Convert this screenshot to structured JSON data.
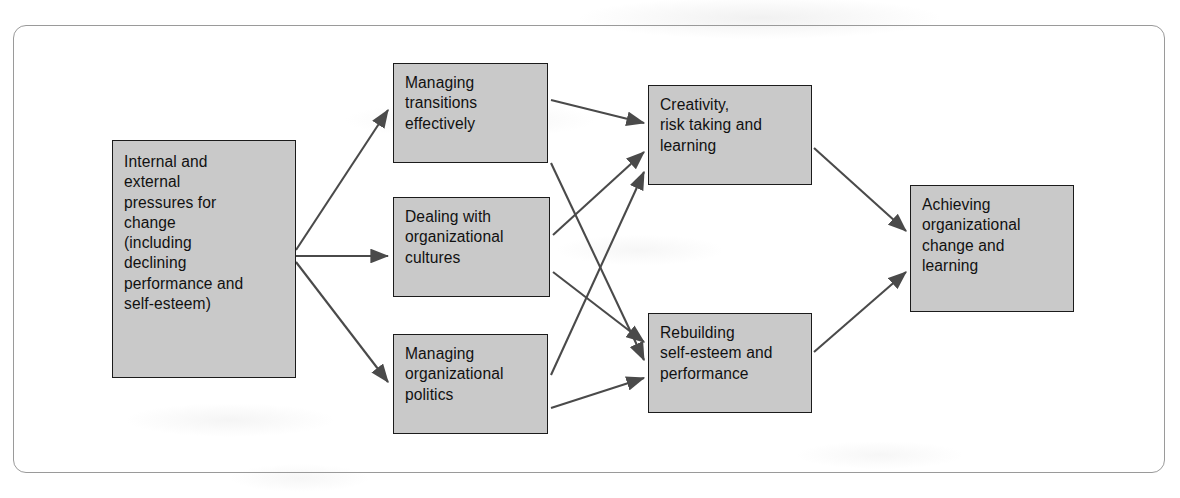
{
  "diagram": {
    "frame": {
      "style": "rounded-rectangle-border",
      "color": "#9a9a9a"
    },
    "node_fill": "#c9c9c9",
    "node_border": "#1b1b1b",
    "arrow_color": "#4a4a4a",
    "nodes": [
      {
        "id": "pressures",
        "label": "Internal and\nexternal\npressures for\nchange\n(including\ndeclining\nperformance and\nself-esteem)",
        "x": 112,
        "y": 140,
        "w": 184,
        "h": 238
      },
      {
        "id": "transitions",
        "label": "Managing\ntransitions\neffectively",
        "x": 393,
        "y": 63,
        "w": 155,
        "h": 100
      },
      {
        "id": "cultures",
        "label": "Dealing with\norganizational\ncultures",
        "x": 393,
        "y": 197,
        "w": 157,
        "h": 100
      },
      {
        "id": "politics",
        "label": "Managing\norganizational\npolitics",
        "x": 393,
        "y": 334,
        "w": 155,
        "h": 100
      },
      {
        "id": "creativity",
        "label": "Creativity,\nrisk taking and\nlearning",
        "x": 648,
        "y": 85,
        "w": 164,
        "h": 100
      },
      {
        "id": "rebuilding",
        "label": "Rebuilding\nself-esteem and\nperformance",
        "x": 648,
        "y": 313,
        "w": 164,
        "h": 100
      },
      {
        "id": "achieving",
        "label": "Achieving\norganizational\nchange and\nlearning",
        "x": 910,
        "y": 185,
        "w": 164,
        "h": 127
      }
    ],
    "edges": [
      {
        "id": "e1",
        "from": "pressures",
        "to": "transitions",
        "x1": 296,
        "y1": 250,
        "x2": 388,
        "y2": 110
      },
      {
        "id": "e2",
        "from": "pressures",
        "to": "cultures",
        "x1": 296,
        "y1": 256,
        "x2": 388,
        "y2": 256
      },
      {
        "id": "e3",
        "from": "pressures",
        "to": "politics",
        "x1": 296,
        "y1": 262,
        "x2": 388,
        "y2": 382
      },
      {
        "id": "e4",
        "from": "transitions",
        "to": "creativity",
        "x1": 551,
        "y1": 100,
        "x2": 644,
        "y2": 123
      },
      {
        "id": "e5",
        "from": "transitions",
        "to": "rebuilding",
        "x1": 551,
        "y1": 163,
        "x2": 644,
        "y2": 360
      },
      {
        "id": "e6",
        "from": "cultures",
        "to": "creativity",
        "x1": 553,
        "y1": 235,
        "x2": 644,
        "y2": 152
      },
      {
        "id": "e7",
        "from": "cultures",
        "to": "rebuilding",
        "x1": 553,
        "y1": 272,
        "x2": 644,
        "y2": 342
      },
      {
        "id": "e8",
        "from": "politics",
        "to": "creativity",
        "x1": 551,
        "y1": 375,
        "x2": 644,
        "y2": 172
      },
      {
        "id": "e9",
        "from": "politics",
        "to": "rebuilding",
        "x1": 551,
        "y1": 408,
        "x2": 644,
        "y2": 378
      },
      {
        "id": "e10",
        "from": "creativity",
        "to": "achieving",
        "x1": 814,
        "y1": 148,
        "x2": 906,
        "y2": 231
      },
      {
        "id": "e11",
        "from": "rebuilding",
        "to": "achieving",
        "x1": 814,
        "y1": 352,
        "x2": 906,
        "y2": 272
      }
    ]
  }
}
